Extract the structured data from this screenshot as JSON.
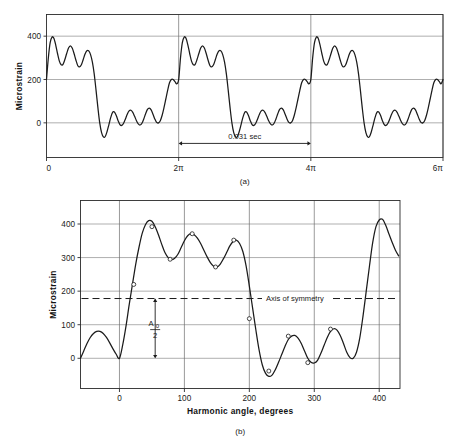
{
  "figure": {
    "panel_a_caption": "(a)",
    "panel_b_caption": "(b)"
  },
  "chart_data": [
    {
      "id": "panel-a",
      "type": "line",
      "title": "",
      "subtitle": "",
      "xlabel": "",
      "ylabel": "Microstrain",
      "xlim": [
        0,
        18.8495559
      ],
      "ylim": [
        -160,
        500
      ],
      "grid": true,
      "grid_y_values": [
        0,
        200,
        400
      ],
      "grid_x_values": [
        6.283185,
        12.566371,
        18.849556
      ],
      "legend": "none",
      "x_tick_positions": [
        0,
        6.283185,
        12.566371,
        18.849556
      ],
      "x_tick_labels": [
        "0",
        "2π",
        "4π",
        "6π"
      ],
      "y_tick_values": [
        0,
        200,
        400
      ],
      "y_tick_labels": [
        "0",
        "200",
        "400"
      ],
      "annotations": [
        {
          "name": "period-measure",
          "text": "0.031  sec",
          "x_from": 6.283185,
          "x_to": 12.566371,
          "y": -95,
          "style": "double-arrow"
        }
      ],
      "comment": "Periodic composite harmonic strain wave, three identical cycles of period 2*pi. Values below are one cycle sampled in degrees of harmonic angle, repeated 3 times.",
      "cycle_x_degrees": [
        0,
        5,
        10,
        15,
        20,
        25,
        30,
        35,
        40,
        45,
        50,
        55,
        60,
        65,
        70,
        75,
        80,
        85,
        90,
        95,
        100,
        105,
        110,
        115,
        120,
        125,
        130,
        135,
        140,
        145,
        150,
        155,
        160,
        165,
        170,
        175,
        180,
        185,
        190,
        195,
        200,
        205,
        210,
        215,
        220,
        225,
        230,
        235,
        240,
        245,
        250,
        255,
        260,
        265,
        270,
        275,
        280,
        285,
        290,
        295,
        300,
        305,
        310,
        315,
        320,
        325,
        330,
        335,
        340,
        345,
        350,
        355,
        360
      ],
      "cycle_y_microstrain": [
        200,
        300,
        370,
        396,
        390,
        360,
        320,
        285,
        268,
        270,
        292,
        320,
        345,
        355,
        345,
        320,
        290,
        265,
        258,
        268,
        292,
        318,
        333,
        332,
        315,
        280,
        225,
        150,
        70,
        0,
        -45,
        -65,
        -63,
        -40,
        -8,
        25,
        48,
        50,
        34,
        10,
        -8,
        -12,
        -2,
        18,
        40,
        55,
        58,
        48,
        30,
        10,
        -5,
        -10,
        -2,
        18,
        42,
        62,
        68,
        60,
        40,
        18,
        2,
        0,
        10,
        35,
        70,
        110,
        150,
        185,
        200,
        200,
        190,
        180,
        200
      ],
      "cycles": 3
    },
    {
      "id": "panel-b",
      "type": "line",
      "title": "",
      "subtitle": "",
      "xlabel": "Harmonic angle, degrees",
      "ylabel": "Microstrain",
      "xlim": [
        -60,
        432
      ],
      "ylim": [
        -90,
        470
      ],
      "grid": true,
      "grid_y_values": [
        0,
        100,
        200,
        300,
        400
      ],
      "grid_x_values": [
        0,
        100,
        200,
        300,
        400
      ],
      "legend": "none",
      "x_tick_positions": [
        0,
        100,
        200,
        300,
        400
      ],
      "x_tick_labels": [
        "0",
        "100",
        "200",
        "300",
        "400"
      ],
      "y_tick_values": [
        0,
        100,
        200,
        300,
        400
      ],
      "y_tick_labels": [
        "0",
        "100",
        "200",
        "300",
        "400"
      ],
      "axis_of_symmetry": {
        "value": 178,
        "label": "Axis of symmetry",
        "style": "dashed"
      },
      "annotations": [
        {
          "name": "a0-over-2-measure",
          "numerator": "A",
          "subscript": "0",
          "denominator": "2",
          "x": 55,
          "y_from": 0,
          "y_to": 178,
          "style": "double-arrow-vertical"
        }
      ],
      "curve_x_degrees": [
        -60,
        -55,
        -50,
        -45,
        -40,
        -35,
        -30,
        -25,
        -20,
        -15,
        -10,
        -5,
        0,
        5,
        10,
        15,
        20,
        25,
        30,
        35,
        40,
        45,
        50,
        55,
        60,
        65,
        70,
        75,
        80,
        85,
        90,
        95,
        100,
        105,
        110,
        115,
        120,
        125,
        130,
        135,
        140,
        145,
        150,
        155,
        160,
        165,
        170,
        175,
        180,
        185,
        190,
        195,
        200,
        205,
        210,
        215,
        220,
        225,
        230,
        235,
        240,
        245,
        250,
        255,
        260,
        265,
        270,
        275,
        280,
        285,
        290,
        295,
        300,
        305,
        310,
        315,
        320,
        325,
        330,
        335,
        340,
        345,
        350,
        355,
        360,
        365,
        370,
        375,
        380,
        385,
        390,
        395,
        400,
        405,
        410,
        415,
        420,
        425,
        430
      ],
      "curve_y_microstrain": [
        0,
        22,
        44,
        62,
        74,
        80,
        80,
        74,
        62,
        46,
        28,
        12,
        0,
        40,
        95,
        160,
        220,
        280,
        330,
        372,
        398,
        410,
        408,
        392,
        368,
        340,
        315,
        300,
        294,
        298,
        310,
        330,
        350,
        365,
        371,
        368,
        358,
        342,
        322,
        302,
        285,
        274,
        272,
        280,
        296,
        315,
        335,
        348,
        352,
        342,
        318,
        275,
        215,
        150,
        85,
        25,
        -20,
        -45,
        -54,
        -50,
        -34,
        -12,
        12,
        36,
        56,
        66,
        68,
        60,
        44,
        22,
        0,
        -12,
        -14,
        -6,
        14,
        38,
        62,
        80,
        88,
        84,
        68,
        44,
        18,
        2,
        0,
        18,
        60,
        125,
        200,
        275,
        345,
        392,
        412,
        414,
        396,
        370,
        345,
        322,
        305
      ],
      "markers_x_degrees": [
        22,
        50,
        78,
        112,
        148,
        176,
        200,
        230,
        260,
        290,
        325
      ],
      "markers_y_microstrain": [
        220,
        392,
        295,
        371,
        272,
        352,
        118,
        -38,
        66,
        -13,
        87
      ]
    }
  ]
}
